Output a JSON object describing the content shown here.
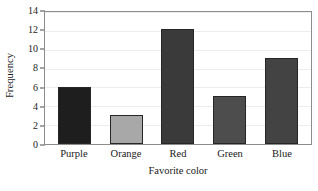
{
  "chart_data": {
    "type": "bar",
    "title": "",
    "subtitle": "",
    "xlabel": "Favorite color",
    "ylabel": "Frequency",
    "categories": [
      "Purple",
      "Orange",
      "Red",
      "Green",
      "Blue"
    ],
    "values": [
      6,
      3,
      12,
      5,
      9
    ],
    "series": [
      {
        "name": "Frequency",
        "values": [
          6,
          3,
          12,
          5,
          9
        ]
      }
    ],
    "bar_colors": [
      "#1e1e1e",
      "#a8a8a8",
      "#3a3a3a",
      "#4d4d4d",
      "#434343"
    ],
    "ylim": [
      0,
      14
    ],
    "yticks": [
      0,
      2,
      4,
      6,
      8,
      10,
      12,
      14
    ],
    "ytick_labels": [
      "0",
      "2",
      "4",
      "6",
      "8",
      "10",
      "12",
      "14"
    ],
    "grid": true,
    "grid_axis": "y",
    "grid_color": "#ededed",
    "legend": false,
    "legend_position": "none",
    "frame": true,
    "frame_color": "#8c8c8c",
    "background_color": "#ffffff",
    "text_color": "#1a1a1a",
    "annotations": []
  }
}
